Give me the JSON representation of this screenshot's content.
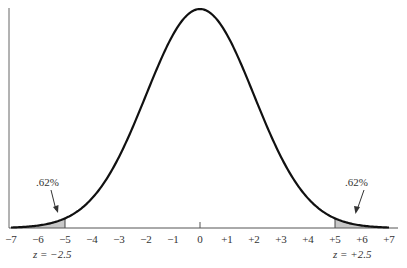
{
  "chart_data": {
    "type": "area",
    "title": "",
    "xlabel": "",
    "ylabel": "",
    "x_ticks": [
      "−7",
      "−6",
      "−5",
      "−4",
      "−3",
      "−2",
      "−1",
      "0",
      "+1",
      "+2",
      "+3",
      "+4",
      "+5",
      "+6",
      "+7"
    ],
    "x_tick_values": [
      -7,
      -6,
      -5,
      -4,
      -3,
      -2,
      -1,
      0,
      1,
      2,
      3,
      4,
      5,
      6,
      7
    ],
    "xlim": [
      -7,
      7
    ],
    "mean": 0,
    "sd": 2,
    "grid": false,
    "legend": null,
    "shaded_regions": [
      {
        "from": -7,
        "to": -5,
        "label": ".62%",
        "z_label": "z = −2.5"
      },
      {
        "from": 5,
        "to": 7,
        "label": ".62%",
        "z_label": "z = +2.5"
      }
    ],
    "annotations": [
      {
        "text": ".62%",
        "points_to": -5.6
      },
      {
        "text": ".62%",
        "points_to": 5.6
      }
    ]
  },
  "labels": {
    "left_tail_pct": ".62%",
    "right_tail_pct": ".62%",
    "left_z": "z = −2.5",
    "right_z": "z = +2.5"
  },
  "colors": {
    "curve": "#111111",
    "shade": "#c8c8c8",
    "axis": "#555555"
  }
}
